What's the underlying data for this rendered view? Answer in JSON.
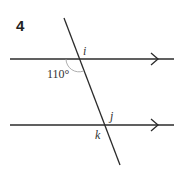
{
  "question": {
    "number": "4"
  },
  "diagram": {
    "angle_given": "110°",
    "labels": {
      "i": "i",
      "j": "j",
      "k": "k"
    },
    "lines": {
      "parallel_count": 2,
      "transversal": 1
    },
    "colors": {
      "line": "#2b2b2b",
      "arc": "#999999"
    }
  }
}
